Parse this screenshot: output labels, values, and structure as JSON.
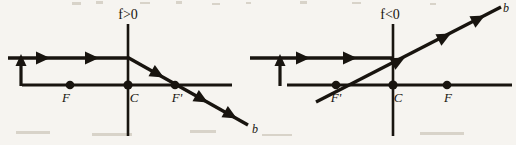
{
  "figure": {
    "kind": "optics-ray-diagram-pair",
    "background_color": "#f6f4f0",
    "ink_color": "#18140f"
  },
  "diagrams": [
    {
      "id": "left",
      "condition_label": "f>0",
      "condition_text_parts": {
        "symbol": "f",
        "relation": ">0"
      },
      "ray_label": "b",
      "points": [
        {
          "label": "F",
          "name": "focal-point-F",
          "x": 70,
          "y": 85
        },
        {
          "label": "C",
          "name": "center-point-C",
          "x": 128,
          "y": 85
        },
        {
          "label": "F'",
          "name": "focal-point-F-prime",
          "x": 175,
          "y": 85
        }
      ],
      "axis": {
        "horizontal": {
          "x1": 22,
          "y1": 85,
          "x2": 232,
          "y2": 85
        },
        "vertical": {
          "x1": 128,
          "y1": 24,
          "x2": 128,
          "y2": 136
        }
      },
      "incoming_ray": {
        "x1": 8,
        "y1": 58,
        "x2": 128,
        "y2": 58
      },
      "incoming_arrow_positions": [
        46,
        95
      ],
      "riser_arrow": {
        "x": 21,
        "y_from": 85,
        "y_to": 57
      },
      "refracted_ray": {
        "x1": 128,
        "y1": 58,
        "x2": 248,
        "y2": 125
      },
      "refracted_arrow_fractions": [
        0.3,
        0.66,
        0.9
      ],
      "b_label_position": {
        "x": 252,
        "y": 129
      }
    },
    {
      "id": "right",
      "condition_label": "f<0",
      "condition_text_parts": {
        "symbol": "f",
        "relation": "<0"
      },
      "ray_label": "b",
      "points": [
        {
          "label": "F'",
          "name": "focal-point-F-prime",
          "x": 336,
          "y": 85
        },
        {
          "label": "C",
          "name": "center-point-C",
          "x": 393,
          "y": 85
        },
        {
          "label": "F",
          "name": "focal-point-F",
          "x": 447,
          "y": 85
        }
      ],
      "axis": {
        "horizontal": {
          "x1": 287,
          "y1": 85,
          "x2": 512,
          "y2": 85
        },
        "vertical": {
          "x1": 393,
          "y1": 24,
          "x2": 393,
          "y2": 136
        }
      },
      "incoming_ray": {
        "x1": 250,
        "y1": 58,
        "x2": 393,
        "y2": 58
      },
      "incoming_arrow_positions": [
        305,
        352
      ],
      "riser_arrow": {
        "x": 280,
        "y_from": 85,
        "y_to": 57
      },
      "refracted_ray": {
        "x1": 318,
        "y1": 101,
        "x2": 500,
        "y2": 8
      },
      "refracted_arrow_fractions": [
        0.47,
        0.72,
        0.92
      ],
      "b_label_position": {
        "x": 503,
        "y": 9
      }
    }
  ]
}
